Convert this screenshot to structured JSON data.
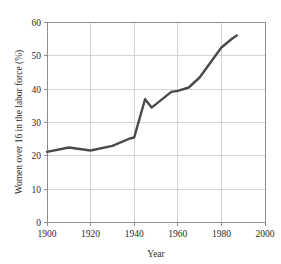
{
  "chart_data": {
    "type": "line",
    "title": "",
    "subtitle": "",
    "xlabel": "Year",
    "ylabel": "Women over 16 in the labor force (%)",
    "xlim": [
      1900,
      2000
    ],
    "ylim": [
      0,
      60
    ],
    "xticks": [
      1900,
      1920,
      1940,
      1960,
      1980,
      2000
    ],
    "xtick_labels": [
      "1900",
      "1920",
      "1940",
      "1960",
      "1980",
      "2000"
    ],
    "yticks": [
      0,
      10,
      20,
      30,
      40,
      50,
      60
    ],
    "ytick_labels": [
      "0",
      "10",
      "20",
      "30",
      "40",
      "50",
      "60"
    ],
    "grid": true,
    "grid_axes": "both",
    "legend": false,
    "legend_position": "none",
    "line_color": "#4a4a4a",
    "grid_color": "#c9c9c9",
    "frame_color": "#8f8f8f",
    "series": [
      {
        "name": "Women over 16 in the labor force",
        "x": [
          1900,
          1910,
          1920,
          1930,
          1938,
          1940,
          1945,
          1948,
          1950,
          1957,
          1960,
          1965,
          1970,
          1975,
          1980,
          1985,
          1987
        ],
        "values": [
          21.2,
          22.5,
          21.6,
          23.0,
          25.2,
          25.5,
          37.0,
          34.5,
          35.5,
          39.2,
          39.5,
          40.5,
          43.5,
          48.0,
          52.5,
          55.2,
          56.1
        ]
      }
    ]
  }
}
